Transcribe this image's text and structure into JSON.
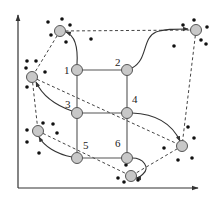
{
  "diagram": {
    "type": "graph-mapping",
    "axes": {
      "color": "#333333"
    },
    "grid_nodes": [
      {
        "id": "1",
        "label": "1",
        "x": 77,
        "y": 70
      },
      {
        "id": "2",
        "label": "2",
        "x": 127,
        "y": 70
      },
      {
        "id": "3",
        "label": "3",
        "x": 77,
        "y": 113
      },
      {
        "id": "4",
        "label": "4",
        "x": 127,
        "y": 113
      },
      {
        "id": "5",
        "label": "5",
        "x": 77,
        "y": 158
      },
      {
        "id": "6",
        "label": "6",
        "x": 127,
        "y": 158
      }
    ],
    "grid_edges": [
      [
        "1",
        "2"
      ],
      [
        "1",
        "3"
      ],
      [
        "2",
        "4"
      ],
      [
        "3",
        "4"
      ],
      [
        "3",
        "5"
      ],
      [
        "4",
        "6"
      ],
      [
        "5",
        "6"
      ]
    ],
    "clusters": [
      {
        "id": "TL",
        "x": 60,
        "y": 31,
        "dots": [
          [
            48,
            22
          ],
          [
            62,
            19
          ],
          [
            70,
            25
          ],
          [
            51,
            35
          ],
          [
            66,
            42
          ]
        ]
      },
      {
        "id": "TR",
        "x": 196,
        "y": 30,
        "dots": [
          [
            183,
            25
          ],
          [
            194,
            20
          ],
          [
            207,
            27
          ],
          [
            174,
            46
          ],
          [
            201,
            40
          ],
          [
            206,
            44
          ]
        ]
      },
      {
        "id": "L",
        "x": 32,
        "y": 77,
        "dots": [
          [
            27,
            61
          ],
          [
            36,
            61
          ],
          [
            26,
            68
          ],
          [
            45,
            72
          ],
          [
            27,
            87
          ]
        ]
      },
      {
        "id": "BL",
        "x": 38,
        "y": 131,
        "dots": [
          [
            43,
            123
          ],
          [
            53,
            124
          ],
          [
            57,
            133
          ],
          [
            27,
            130
          ],
          [
            39,
            153
          ],
          [
            27,
            142
          ]
        ]
      },
      {
        "id": "R",
        "x": 182,
        "y": 146,
        "dots": [
          [
            188,
            127
          ],
          [
            194,
            138
          ],
          [
            164,
            148
          ],
          [
            178,
            160
          ],
          [
            192,
            158
          ]
        ]
      },
      {
        "id": "BM",
        "x": 131,
        "y": 176,
        "dots": [
          [
            126,
            165
          ],
          [
            118,
            178
          ],
          [
            124,
            182
          ],
          [
            138,
            180
          ]
        ]
      }
    ],
    "free_dots": [
      [
        91,
        39
      ]
    ],
    "mappings": [
      {
        "from": "1",
        "to": "TL"
      },
      {
        "from": "2",
        "to": "TR"
      },
      {
        "from": "3",
        "to": "L"
      },
      {
        "from": "5",
        "to": "BL"
      },
      {
        "from": "4",
        "to": "R"
      },
      {
        "from": "6",
        "to": "BM"
      }
    ],
    "dashed_edges": [
      [
        "TL",
        "TR"
      ],
      [
        "TL",
        "L"
      ],
      [
        "L",
        "BL"
      ],
      [
        "L",
        "R"
      ],
      [
        "BL",
        "BM"
      ],
      [
        "TR",
        "R"
      ],
      [
        "R",
        "BM"
      ]
    ],
    "colors": {
      "node_fill": "#c8c8c8",
      "node_stroke": "#555555",
      "line": "#444444",
      "dot": "#111111"
    }
  }
}
